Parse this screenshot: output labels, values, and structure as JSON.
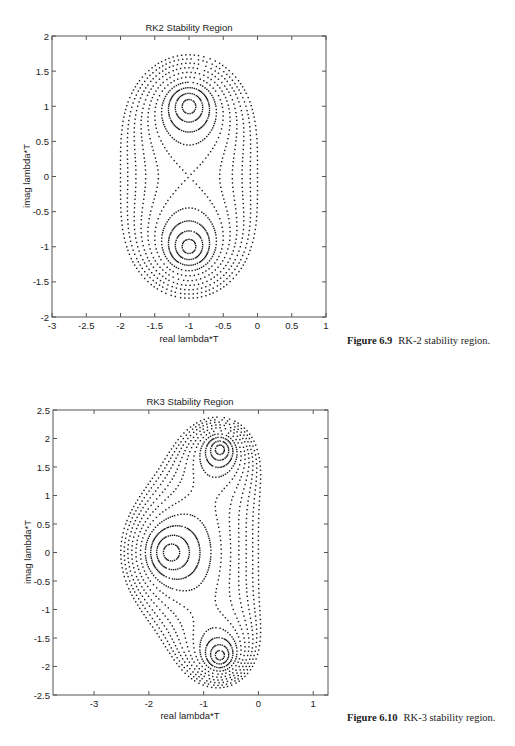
{
  "chart_data": [
    {
      "type": "scatter",
      "title": "RK2  Stability  Region",
      "xlabel": "real  lambda*T",
      "ylabel": "imag  lambda*T",
      "xlim": [
        -3,
        1
      ],
      "ylim": [
        -2,
        2
      ],
      "xticks": [
        -3,
        -2.5,
        -2,
        -1.5,
        -1,
        -0.5,
        0,
        0.5,
        1
      ],
      "xtick_labels": [
        "-3",
        "-2.5",
        "-2",
        "-1.5",
        "-1",
        "-0.5",
        "0",
        "0.5",
        "1"
      ],
      "yticks": [
        -2,
        -1.5,
        -1,
        -0.5,
        0,
        0.5,
        1,
        1.5,
        2
      ],
      "ytick_labels": [
        "-2",
        "-1.5",
        "-1",
        "-0.5",
        "0",
        "0.5",
        "1",
        "1.5",
        "2"
      ],
      "grid": false,
      "description": "Dotted contour lines of |1 + z + z^2/2| for levels 0.1 to 1.0",
      "polynomial_coefficients": [
        1,
        1,
        0.5
      ],
      "contour_levels": [
        0.1,
        0.2,
        0.3,
        0.4,
        0.5,
        0.6,
        0.7,
        0.8,
        0.9,
        1.0
      ],
      "roots": [
        [
          -1,
          1
        ],
        [
          -1,
          -1
        ]
      ]
    },
    {
      "type": "scatter",
      "title": "RK3  Stability  Region",
      "xlabel": "real  lambda*T",
      "ylabel": "imag  lambda*T",
      "xlim": [
        -3.75,
        1.27
      ],
      "ylim": [
        -2.5,
        2.5
      ],
      "xticks": [
        -3,
        -2,
        -1,
        0,
        1
      ],
      "xtick_labels": [
        "-3",
        "-2",
        "-1",
        "0",
        "1"
      ],
      "yticks": [
        -2.5,
        -2,
        -1.5,
        -1,
        -0.5,
        0,
        0.5,
        1,
        1.5,
        2,
        2.5
      ],
      "ytick_labels": [
        "-2.5",
        "-2",
        "-1.5",
        "-1",
        "-0.5",
        "0",
        "0.5",
        "1",
        "1.5",
        "2",
        "2.5"
      ],
      "grid": false,
      "description": "Dotted contour lines of |1 + z + z^2/2 + z^3/6| for levels 0.1 to 1.0",
      "polynomial_coefficients": [
        1,
        1,
        0.5,
        0.16666667
      ],
      "contour_levels": [
        0.1,
        0.2,
        0.3,
        0.4,
        0.5,
        0.6,
        0.7,
        0.8,
        0.9,
        1.0
      ],
      "roots": [
        [
          -1.596,
          0
        ],
        [
          -0.702,
          1.807
        ],
        [
          -0.702,
          -1.807
        ]
      ]
    }
  ],
  "captions": [
    {
      "label": "Figure 6.9",
      "text": "RK-2 stability region."
    },
    {
      "label": "Figure 6.10",
      "text": "RK-3 stability region."
    }
  ]
}
